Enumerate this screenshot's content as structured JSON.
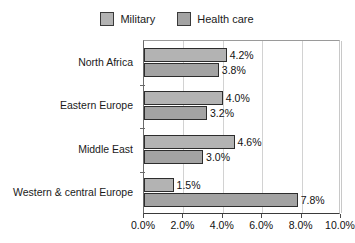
{
  "chart_data": {
    "type": "bar",
    "orientation": "horizontal",
    "title": "",
    "xlabel": "",
    "ylabel": "",
    "xlim": [
      0,
      10
    ],
    "xticks": [
      0,
      2,
      4,
      6,
      8,
      10
    ],
    "xtick_labels": [
      "0.0%",
      "2.0%",
      "4.0%",
      "6.0%",
      "8.0%",
      "10.0%"
    ],
    "grid": true,
    "legend_position": "top-center",
    "categories": [
      "North Africa",
      "Eastern Europe",
      "Middle East",
      "Western & central Europe"
    ],
    "series": [
      {
        "name": "Military",
        "color": "#b3b3b3",
        "values": [
          4.2,
          4.0,
          4.6,
          1.5
        ],
        "labels": [
          "4.2%",
          "4.0%",
          "4.6%",
          "1.5%"
        ]
      },
      {
        "name": "Health care",
        "color": "#a3a3a3",
        "values": [
          3.8,
          3.2,
          3.0,
          7.8
        ],
        "labels": [
          "3.8%",
          "3.2%",
          "3.0%",
          "7.8%"
        ]
      }
    ]
  },
  "legend": {
    "entries": [
      {
        "label": "Military",
        "color": "#b3b3b3"
      },
      {
        "label": "Health care",
        "color": "#a3a3a3"
      }
    ]
  },
  "colors": {
    "military": "#b3b3b3",
    "health_care": "#a3a3a3",
    "bar_border": "#2d2d2d",
    "gridline": "#d2d2d2",
    "axis": "#3a3a3a",
    "text": "#1a1a1a",
    "background": "#ffffff"
  }
}
